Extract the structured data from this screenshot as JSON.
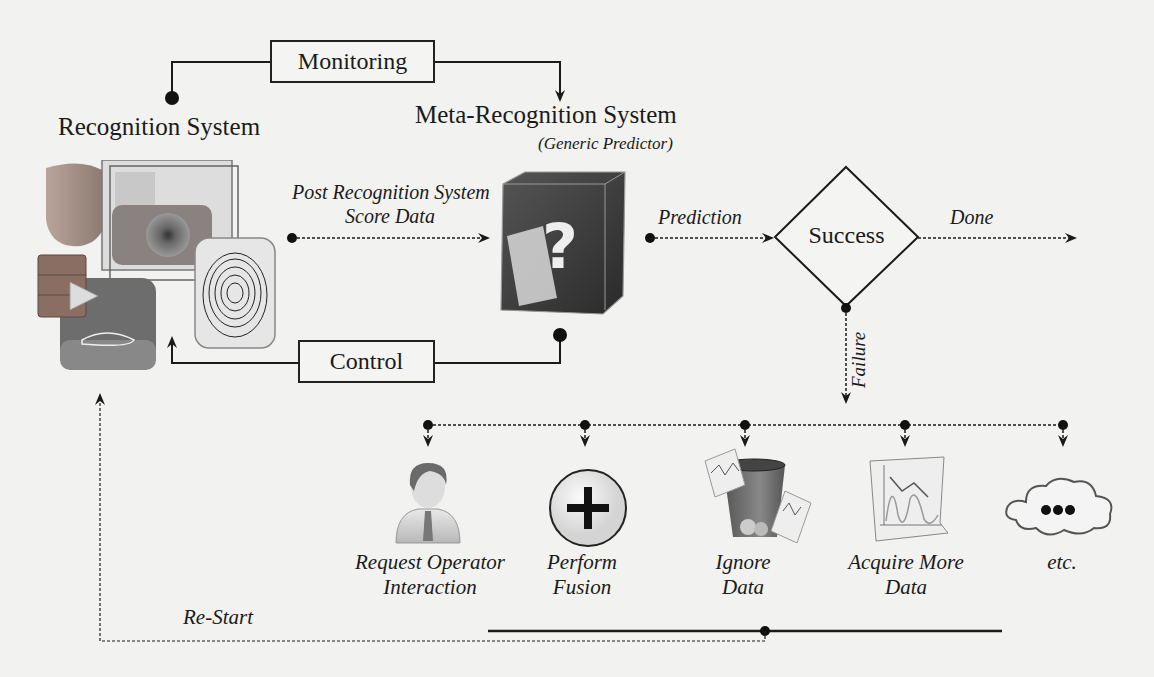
{
  "diagram": {
    "recognition_system": {
      "title": "Recognition System"
    },
    "meta_system": {
      "title": "Meta-Recognition System",
      "subtitle": "Generic Predictor"
    },
    "monitoring_box": {
      "label": "Monitoring"
    },
    "control_box": {
      "label": "Control"
    },
    "score_data_label": {
      "line1": "Post Recognition System",
      "line2": "Score Data"
    },
    "prediction_label": "Prediction",
    "decision": {
      "label": "Success"
    },
    "done_label": "Done",
    "failure_label": "Failure",
    "restart_label": "Re-Start",
    "actions": [
      {
        "id": "operator",
        "icon": "person-icon",
        "line1": "Request Operator",
        "line2": "Interaction"
      },
      {
        "id": "fusion",
        "icon": "plus-circle-icon",
        "line1": "Perform",
        "line2": "Fusion"
      },
      {
        "id": "ignore",
        "icon": "trash-icon",
        "line1": "Ignore",
        "line2": "Data"
      },
      {
        "id": "acquire",
        "icon": "chart-sheet-icon",
        "line1": "Acquire More",
        "line2": "Data"
      },
      {
        "id": "etc",
        "icon": "cloud-ellipsis-icon",
        "line1": "etc.",
        "line2": ""
      }
    ],
    "cube_glyph": "?"
  },
  "colors": {
    "line": "#1a1a1a",
    "background": "#f2f2f0"
  }
}
